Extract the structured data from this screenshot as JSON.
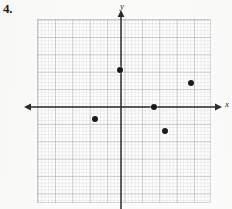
{
  "problem": {
    "number_label": "4."
  },
  "graph": {
    "x_axis_label": "x",
    "y_axis_label": "y",
    "axis_color": "#2b2b2b",
    "point_color": "#1a1a1a",
    "grid_line_color": "#96989e",
    "paper_color": "#fbfbfa",
    "origin_px": {
      "x": 121,
      "y": 107
    },
    "unit_px": 17.4,
    "grid_bounds_px": {
      "left": 37,
      "top": 19,
      "width": 174,
      "height": 184
    },
    "x_axis_span_px": {
      "from": 24,
      "to": 222
    },
    "y_axis_span_px": {
      "from": 10,
      "to": 209
    }
  },
  "chart_data": {
    "type": "scatter",
    "title": "",
    "xlabel": "x",
    "ylabel": "y",
    "grid": true,
    "legend": "none",
    "xlim": [
      -4.8,
      5.2
    ],
    "ylim": [
      -5.5,
      5.1
    ],
    "points": [
      {
        "label": "point-1",
        "x": 0.0,
        "y": 2.1,
        "px": 120,
        "py": 70
      },
      {
        "label": "point-2",
        "x": 4.0,
        "y": 1.4,
        "px": 191,
        "py": 83
      },
      {
        "label": "point-3",
        "x": 1.9,
        "y": 0.0,
        "px": 154,
        "py": 107
      },
      {
        "label": "point-4",
        "x": -1.5,
        "y": -0.7,
        "px": 95,
        "py": 119
      },
      {
        "label": "point-5",
        "x": 2.5,
        "y": -1.4,
        "px": 165,
        "py": 131
      }
    ]
  }
}
